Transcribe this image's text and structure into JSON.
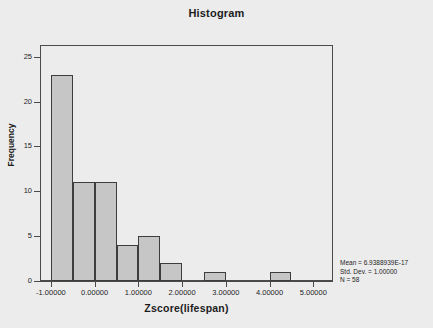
{
  "chart_data": {
    "type": "bar",
    "title": "Histogram",
    "xlabel": "Zscore(lifespan)",
    "ylabel": "Frequency",
    "xlim": [
      -1.25,
      5.45
    ],
    "ylim": [
      0,
      26.3
    ],
    "bin_width": 0.5,
    "bin_starts": [
      -1.0,
      -0.5,
      0.0,
      0.5,
      1.0,
      1.5,
      2.0,
      2.5,
      3.0,
      3.5,
      4.0
    ],
    "categories": [
      "-1.0 to -0.5",
      "-0.5 to 0.0",
      "0.0 to 0.5",
      "0.5 to 1.0",
      "1.0 to 1.5",
      "1.5 to 2.0",
      "2.0 to 2.5",
      "2.5 to 3.0",
      "3.0 to 3.5",
      "3.5 to 4.0",
      "4.0 to 4.5"
    ],
    "values": [
      23,
      11,
      11,
      4,
      5,
      2,
      0,
      1,
      0,
      0,
      1
    ],
    "x_ticks": [
      -1,
      0,
      1,
      2,
      3,
      4,
      5
    ],
    "x_tick_labels": [
      "-1.00000",
      "0.00000",
      "1.00000",
      "2.00000",
      "3.00000",
      "4.00000",
      "5.00000"
    ],
    "y_ticks": [
      0,
      5,
      10,
      15,
      20,
      25
    ],
    "y_tick_labels": [
      "0",
      "5",
      "10",
      "15",
      "20",
      "25"
    ],
    "grid": false,
    "legend": false,
    "bar_fill_color": "#c6c6c6",
    "bar_edge_color": "#3d3d3d",
    "background_color": "#ececed",
    "axis_color": "#4a4a4a"
  },
  "annotations": {
    "mean_text": "Mean = 6.9388939E-17",
    "std_dev_text": "Std. Dev. = 1.00000",
    "n_text": "N = 58"
  }
}
